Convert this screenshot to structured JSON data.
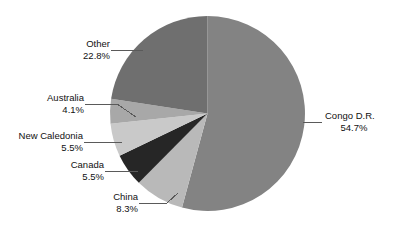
{
  "chart_data": {
    "type": "pie",
    "title": "",
    "subtitle": "",
    "xlabel": "",
    "ylabel": "",
    "legend_position": "none",
    "grid": false,
    "labels_show_percent": true,
    "start_angle_deg": 0,
    "direction": "clockwise",
    "categories": [
      "Congo D.R.",
      "China",
      "Canada",
      "New Caledonia",
      "Australia",
      "Other"
    ],
    "values": [
      54.7,
      8.3,
      5.5,
      5.5,
      4.1,
      22.8
    ],
    "units": "%",
    "slices": [
      {
        "label": "Congo D.R.",
        "value": 54.7,
        "percent_text": "54.7%",
        "color": "#838383"
      },
      {
        "label": "China",
        "value": 8.3,
        "percent_text": "8.3%",
        "color": "#b9b9b9"
      },
      {
        "label": "Canada",
        "value": 5.5,
        "percent_text": "5.5%",
        "color": "#262626"
      },
      {
        "label": "New Caledonia",
        "value": 5.5,
        "percent_text": "5.5%",
        "color": "#c9c9c9"
      },
      {
        "label": "Australia",
        "value": 4.1,
        "percent_text": "4.1%",
        "color": "#a8a8a8"
      },
      {
        "label": "Other",
        "value": 22.8,
        "percent_text": "22.8%",
        "color": "#6f6f6f"
      }
    ]
  },
  "callouts": [
    {
      "name": "Congo D.R.",
      "pct": "54.7%"
    },
    {
      "name": "China",
      "pct": "8.3%"
    },
    {
      "name": "Canada",
      "pct": "5.5%"
    },
    {
      "name": "New Caledonia",
      "pct": "5.5%"
    },
    {
      "name": "Australia",
      "pct": "4.1%"
    },
    {
      "name": "Other",
      "pct": "22.8%"
    }
  ],
  "colors": {
    "background": "#ffffff",
    "text": "#111111",
    "leader_line": "#5a5a5a",
    "congo": "#838383",
    "china": "#b9b9b9",
    "canada": "#262626",
    "new_caledonia": "#c9c9c9",
    "australia": "#a8a8a8",
    "other": "#6f6f6f"
  }
}
